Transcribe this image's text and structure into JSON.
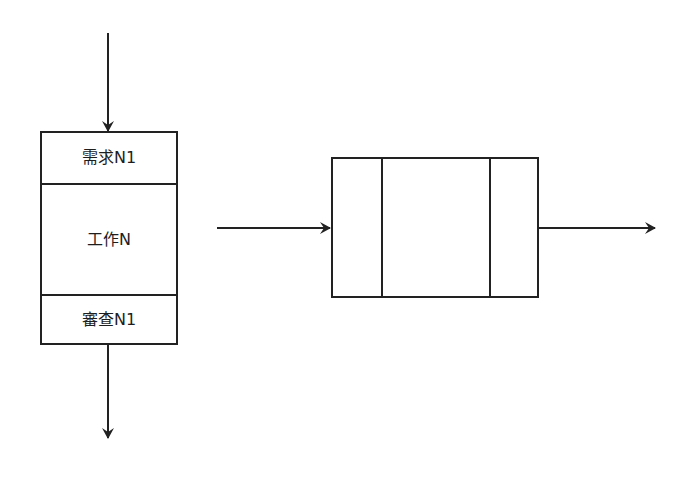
{
  "diagram": {
    "type": "flow",
    "stroke_color": "#222222",
    "background": "#ffffff",
    "left_block": {
      "sections": [
        {
          "id": "requirement",
          "label": "需求N1"
        },
        {
          "id": "work",
          "label": "工作N"
        },
        {
          "id": "review",
          "label": "審查N1"
        }
      ]
    },
    "right_block": {
      "sections": [
        {
          "id": "left-cell",
          "label": ""
        },
        {
          "id": "middle-cell",
          "label": ""
        },
        {
          "id": "right-cell",
          "label": ""
        }
      ]
    },
    "arrows": [
      {
        "id": "input-arrow",
        "direction": "down",
        "target": "left_block"
      },
      {
        "id": "output-arrow",
        "direction": "down",
        "source": "left_block"
      },
      {
        "id": "into-right-block-arrow",
        "direction": "right",
        "target": "right_block"
      },
      {
        "id": "out-of-right-block-arrow",
        "direction": "right",
        "source": "right_block"
      }
    ]
  }
}
